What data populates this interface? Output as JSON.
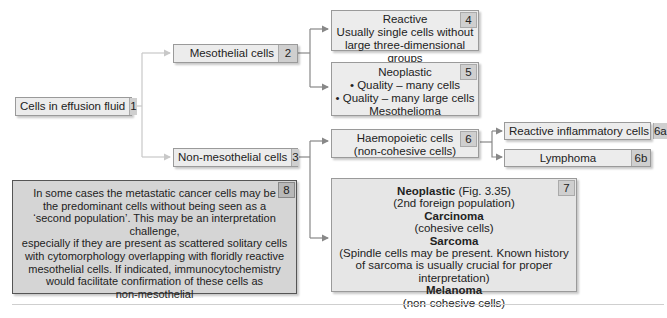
{
  "diagram": {
    "type": "flowchart",
    "nodes": [
      {
        "id": "1",
        "label": "Cells in effusion fluid"
      },
      {
        "id": "2",
        "label": "Mesothelial cells"
      },
      {
        "id": "3",
        "label": "Non-mesothelial cells"
      },
      {
        "id": "4",
        "lines": [
          "Reactive",
          "Usually single cells without",
          "large three-dimensional groups"
        ]
      },
      {
        "id": "5",
        "lines": [
          "Neoplastic",
          "• Quality – many cells",
          "• Quality – many large cells",
          "Mesothelioma"
        ]
      },
      {
        "id": "6",
        "lines": [
          "Haemopoietic cells",
          "(non-cohesive cells)"
        ]
      },
      {
        "id": "6a",
        "label": "Reactive inflammatory cells"
      },
      {
        "id": "6b",
        "label": "Lymphoma"
      },
      {
        "id": "7",
        "lines": [
          {
            "bold": "Neoplastic",
            "rest": " (Fig. 3.35)"
          },
          "(2nd foreign population)",
          {
            "bold": "Carcinoma"
          },
          "(cohesive cells)",
          {
            "bold": "Sarcoma"
          },
          "(Spindle cells may be present. Known history",
          "of sarcoma is usually crucial for proper interpretation)",
          {
            "bold": "Melanoma"
          },
          "(non-cohesive cells)"
        ]
      },
      {
        "id": "8",
        "lines": [
          "In some cases the metastatic cancer cells may be",
          "the predominant cells without being seen as a",
          "‘second population’. This may be an interpretation challenge,",
          "especially if they are present as scattered solitary cells",
          "with cytomorphology overlapping with floridly reactive",
          "mesothelial cells. If indicated, immunocytochemistry",
          "would facilitate confirmation of these cells as",
          "non-mesothelial"
        ]
      }
    ],
    "edges": [
      [
        "1",
        "2"
      ],
      [
        "1",
        "3"
      ],
      [
        "2",
        "4"
      ],
      [
        "2",
        "5"
      ],
      [
        "3",
        "6"
      ],
      [
        "3",
        "7"
      ],
      [
        "6",
        "6a"
      ],
      [
        "6",
        "6b"
      ]
    ],
    "colors": {
      "box_fill": "#ececec",
      "number_fill": "#cfcfcf",
      "note_fill": "#d5d5d5",
      "line_light": "#c8c8c8",
      "line_dark": "#888888"
    }
  },
  "n1": {
    "label": "Cells in effusion fluid",
    "num": "1"
  },
  "n2": {
    "label": "Mesothelial cells",
    "num": "2"
  },
  "n3": {
    "label": "Non-mesothelial cells",
    "num": "3"
  },
  "n4": {
    "num": "4",
    "l1": "Reactive",
    "l2": "Usually single cells without",
    "l3": "large three-dimensional groups"
  },
  "n5": {
    "num": "5",
    "l1": "Neoplastic",
    "l2": "• Quality – many cells",
    "l3": "• Quality – many large cells",
    "l4": "Mesothelioma"
  },
  "n6": {
    "num": "6",
    "l1": "Haemopoietic cells",
    "l2": "(non-cohesive cells)"
  },
  "n6a": {
    "label": "Reactive inflammatory cells",
    "num": "6a"
  },
  "n6b": {
    "label": "Lymphoma",
    "num": "6b"
  },
  "n7": {
    "num": "7",
    "b1": "Neoplastic",
    "r1": " (Fig. 3.35)",
    "l2": "(2nd foreign population)",
    "b3": "Carcinoma",
    "l4": "(cohesive cells)",
    "b5": "Sarcoma",
    "l6": "(Spindle cells may be present. Known history",
    "l7": "of sarcoma is usually crucial for proper interpretation)",
    "b8": "Melanoma",
    "l9": "(non-cohesive cells)"
  },
  "n8": {
    "num": "8",
    "l1": "In some cases the metastatic cancer cells may be",
    "l2": "the predominant cells without being seen as a",
    "l3": "‘second population’. This may be an interpretation challenge,",
    "l4": "especially if they are present as scattered solitary cells",
    "l5": "with cytomorphology overlapping with floridly reactive",
    "l6": "mesothelial cells. If indicated, immunocytochemistry",
    "l7": "would facilitate confirmation of these cells as",
    "l8": "non-mesothelial"
  }
}
